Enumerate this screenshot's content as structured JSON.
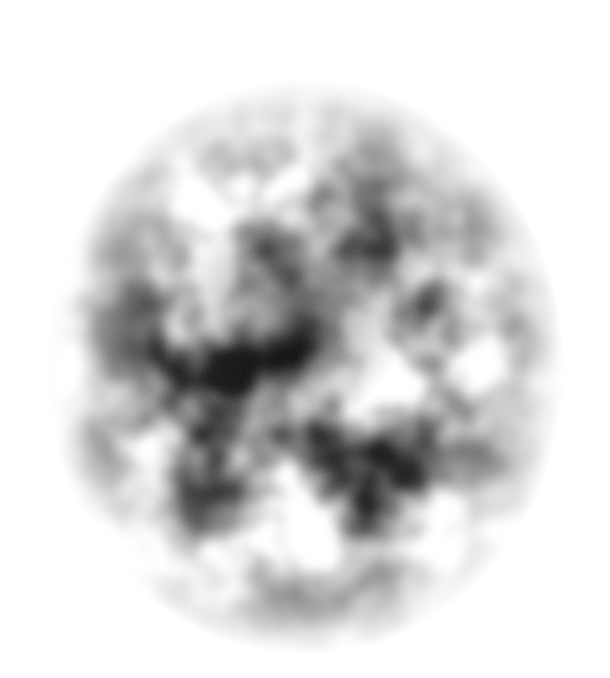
{
  "image": {
    "description": "grayscale blurred noise cloud on white background",
    "background_color": "#ffffff",
    "cloud_color": "#1a1a1a",
    "center": [
      305,
      355
    ],
    "radius": [
      265,
      290
    ]
  }
}
